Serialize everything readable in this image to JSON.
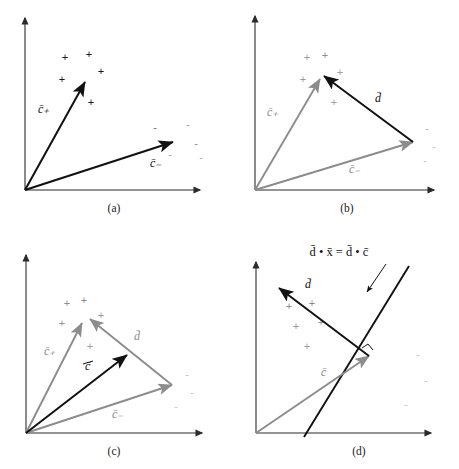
{
  "figure": {
    "type": "vector-geometry-diagram",
    "background_color": "#ffffff",
    "ink_color": "#111111",
    "secondary_color": "#8c8c8c",
    "marker_plus_glyph": "+",
    "marker_minus_glyph": "-"
  },
  "labels": {
    "c_plus": "c̄₊",
    "c_minus": "c̄₋",
    "d": "d̄",
    "c_bar": "c̄",
    "equation": "d̄ • x̄ = d̄ • c̄"
  },
  "panels": [
    {
      "id": "a",
      "caption": "(a)",
      "vectors": [
        {
          "name": "c_plus",
          "label": "c̄₊",
          "color": "#111111",
          "from": [
            25,
            190
          ],
          "to": [
            85,
            82
          ]
        },
        {
          "name": "c_minus",
          "label": "c̄₋",
          "color": "#111111",
          "from": [
            25,
            190
          ],
          "to": [
            173,
            142
          ]
        }
      ],
      "plus_points": [
        [
          65,
          57
        ],
        [
          89,
          54
        ],
        [
          101,
          71
        ],
        [
          62,
          79
        ],
        [
          91,
          102
        ]
      ],
      "minus_points": [
        [
          155,
          127
        ],
        [
          188,
          124
        ],
        [
          192,
          142
        ],
        [
          200,
          155
        ],
        [
          170,
          152
        ]
      ]
    },
    {
      "id": "b",
      "caption": "(b)",
      "vectors": [
        {
          "name": "c_plus",
          "label": "c̄₊",
          "color": "#8c8c8c",
          "from": [
            26,
            190
          ],
          "to": [
            91,
            79
          ]
        },
        {
          "name": "c_minus",
          "label": "c̄₋",
          "color": "#8c8c8c",
          "from": [
            26,
            190
          ],
          "to": [
            184,
            142
          ]
        },
        {
          "name": "d",
          "label": "d̄",
          "color": "#111111",
          "from": [
            184,
            142
          ],
          "to": [
            95,
            76
          ]
        }
      ],
      "plus_points": [
        [
          78,
          57
        ],
        [
          96,
          55
        ],
        [
          104,
          72
        ],
        [
          74,
          79
        ],
        [
          105,
          102
        ]
      ],
      "minus_points": [
        [
          196,
          128
        ],
        [
          203,
          146
        ],
        [
          196,
          160
        ]
      ]
    },
    {
      "id": "c",
      "caption": "(c)",
      "vectors": [
        {
          "name": "c_plus",
          "label": "c̄₊",
          "color": "#8c8c8c",
          "from": [
            26,
            199
          ],
          "to": [
            82,
            89
          ]
        },
        {
          "name": "c_minus",
          "label": "c̄₋",
          "color": "#8c8c8c",
          "from": [
            26,
            199
          ],
          "to": [
            172,
            151
          ]
        },
        {
          "name": "d",
          "label": "d̄",
          "color": "#8c8c8c",
          "from": [
            172,
            151
          ],
          "to": [
            90,
            85
          ]
        },
        {
          "name": "c_bar",
          "label": "c̄",
          "color": "#111111",
          "from": [
            26,
            199
          ],
          "to": [
            127,
            121
          ]
        }
      ],
      "plus_points": [
        [
          67,
          69
        ],
        [
          84,
          66
        ],
        [
          101,
          81
        ],
        [
          62,
          89
        ],
        [
          90,
          112
        ]
      ],
      "minus_points": [
        [
          185,
          140
        ],
        [
          190,
          158
        ],
        [
          176,
          172
        ]
      ]
    },
    {
      "id": "d",
      "caption": "(d)",
      "vectors": [
        {
          "name": "c_bar",
          "label": "c̄",
          "color": "#8c8c8c",
          "from": [
            27,
            199
          ],
          "to": [
            140,
            122
          ]
        },
        {
          "name": "d",
          "label": "d̄",
          "color": "#111111",
          "from": [
            140,
            122
          ],
          "to": [
            50,
            54
          ]
        }
      ],
      "boundary": {
        "name": "decision-boundary",
        "from": [
          75,
          203
        ],
        "to": [
          180,
          32
        ]
      },
      "annotation": {
        "text": "d̄ • x̄ = d̄ • c̄",
        "text_pos": [
          108,
          18
        ],
        "leader_from": [
          157,
          30
        ],
        "leader_to": [
          138,
          58
        ]
      },
      "plus_points": [
        [
          60,
          72
        ],
        [
          83,
          69
        ],
        [
          88,
          88
        ],
        [
          67,
          92
        ],
        [
          78,
          112
        ]
      ],
      "minus_points": [
        [
          188,
          120
        ],
        [
          196,
          146
        ],
        [
          176,
          170
        ]
      ]
    }
  ]
}
